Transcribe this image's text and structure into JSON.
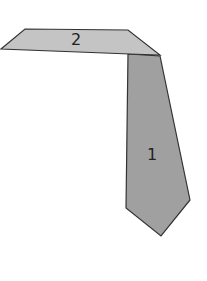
{
  "diagram": {
    "shapes": [
      {
        "id": "shape-1",
        "label": "1",
        "fill": "#a0a0a0",
        "stroke": "#333333",
        "points": "128,54 160,56 190,200 161,236 126,208",
        "label_x": 152,
        "label_y": 160
      },
      {
        "id": "shape-2",
        "label": "2",
        "fill": "#c4c4c4",
        "stroke": "#333333",
        "points": "25,29 128,30 160,55 130,54 1,49",
        "label_x": 76,
        "label_y": 45
      }
    ]
  }
}
